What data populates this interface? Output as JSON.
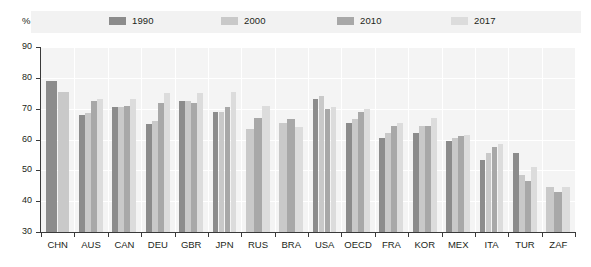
{
  "axis": {
    "unit_label": "%",
    "y_ticks": [
      30,
      40,
      50,
      60,
      70,
      80,
      90
    ],
    "y_min": 30,
    "y_max": 90
  },
  "legend": {
    "items": [
      {
        "label": "1990",
        "color": "#8c8c8c",
        "swatch_name": "legend-swatch-1990"
      },
      {
        "label": "2000",
        "color": "#c9c9c9",
        "swatch_name": "legend-swatch-2000"
      },
      {
        "label": "2010",
        "color": "#a8a8a8",
        "swatch_name": "legend-swatch-2010"
      },
      {
        "label": "2017",
        "color": "#dcdcdc",
        "swatch_name": "legend-swatch-2017"
      }
    ]
  },
  "chart_data": {
    "type": "bar",
    "title": "",
    "xlabel": "",
    "ylabel": "%",
    "ylim": [
      30,
      90
    ],
    "grid": true,
    "legend_position": "top",
    "categories": [
      "CHN",
      "AUS",
      "CAN",
      "DEU",
      "GBR",
      "JPN",
      "RUS",
      "BRA",
      "USA",
      "OECD",
      "FRA",
      "KOR",
      "MEX",
      "ITA",
      "TUR",
      "ZAF"
    ],
    "series": [
      {
        "name": "1990",
        "color": "#8c8c8c",
        "values": [
          79.0,
          68.0,
          70.5,
          65.0,
          72.5,
          69.0,
          null,
          null,
          73.0,
          65.5,
          60.5,
          62.0,
          59.5,
          53.5,
          55.5,
          null
        ]
      },
      {
        "name": "2000",
        "color": "#c9c9c9",
        "values": [
          75.5,
          68.5,
          70.5,
          66.0,
          72.5,
          69.0,
          63.5,
          65.5,
          74.0,
          66.5,
          62.0,
          64.5,
          60.5,
          55.5,
          48.5,
          44.5
        ]
      },
      {
        "name": "2010",
        "color": "#a8a8a8",
        "values": [
          null,
          72.5,
          71.0,
          72.0,
          72.0,
          70.5,
          67.0,
          66.5,
          70.0,
          69.0,
          64.5,
          64.5,
          61.0,
          57.5,
          46.5,
          43.0
        ]
      },
      {
        "name": "2017",
        "color": "#dcdcdc",
        "values": [
          null,
          73.0,
          73.0,
          75.0,
          75.0,
          75.5,
          71.0,
          64.0,
          70.5,
          70.0,
          65.5,
          67.0,
          61.5,
          58.5,
          51.0,
          44.5
        ]
      }
    ]
  },
  "colors": {
    "plot_background": "#f4f4f4",
    "legend_background": "#f2f2f2",
    "gridline": "#ffffff",
    "axis": "#3a3a3a",
    "text": "#231f20"
  }
}
